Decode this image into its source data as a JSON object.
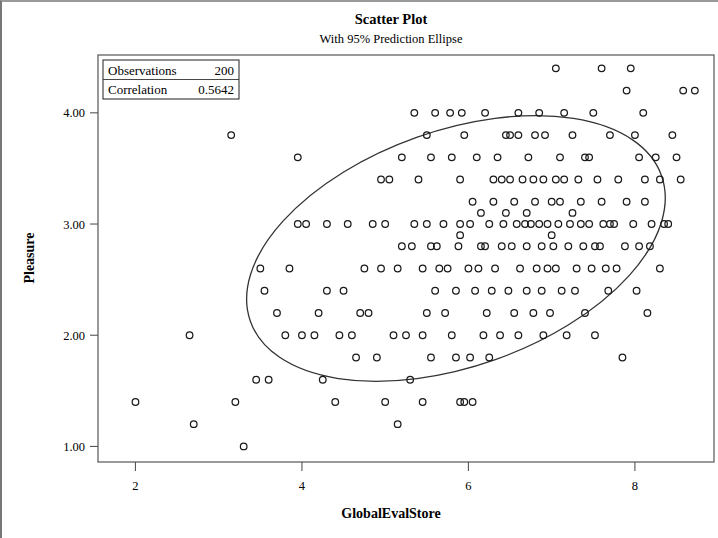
{
  "chart_data": {
    "type": "scatter",
    "title": "Scatter Plot",
    "subtitle": "With 95% Prediction Ellipse",
    "xlabel": "GlobalEvalStore",
    "ylabel": "Pleasure",
    "xlim": [
      1.55,
      8.95
    ],
    "ylim": [
      0.86,
      4.52
    ],
    "xticks": [
      2,
      4,
      6,
      8
    ],
    "xticklabels": [
      "2",
      "4",
      "6",
      "8"
    ],
    "yticks": [
      1.0,
      2.0,
      3.0,
      4.0
    ],
    "yticklabels": [
      "1.00",
      "2.00",
      "3.00",
      "4.00"
    ],
    "grid": false,
    "marker": "open-circle",
    "marker_color": "#1a1a1a",
    "legend": {
      "position": "top-left-inside",
      "rows": [
        {
          "label": "Observations",
          "value": "200"
        },
        {
          "label": "Correlation",
          "value": "0.5642"
        }
      ]
    },
    "annotations": [
      {
        "type": "ellipse",
        "label": "95% Prediction Ellipse",
        "cx": 5.85,
        "cy": 2.78,
        "rx": 2.62,
        "ry": 1.06,
        "rotation_deg": -19.5
      }
    ],
    "points": [
      [
        2.0,
        1.4
      ],
      [
        2.65,
        2.0
      ],
      [
        2.7,
        1.2
      ],
      [
        3.15,
        3.8
      ],
      [
        3.2,
        1.4
      ],
      [
        3.3,
        1.0
      ],
      [
        3.45,
        1.6
      ],
      [
        3.6,
        1.6
      ],
      [
        3.55,
        2.4
      ],
      [
        3.5,
        2.6
      ],
      [
        3.85,
        2.6
      ],
      [
        3.95,
        3.6
      ],
      [
        3.95,
        3.0
      ],
      [
        4.0,
        2.0
      ],
      [
        4.15,
        2.0
      ],
      [
        4.25,
        1.6
      ],
      [
        4.2,
        2.2
      ],
      [
        4.3,
        2.4
      ],
      [
        4.5,
        2.4
      ],
      [
        4.55,
        3.0
      ],
      [
        4.7,
        2.2
      ],
      [
        4.75,
        2.6
      ],
      [
        4.85,
        3.0
      ],
      [
        4.9,
        1.8
      ],
      [
        4.95,
        2.6
      ],
      [
        5.0,
        1.4
      ],
      [
        5.05,
        3.4
      ],
      [
        5.15,
        1.2
      ],
      [
        5.2,
        2.8
      ],
      [
        5.2,
        3.6
      ],
      [
        5.35,
        4.0
      ],
      [
        5.4,
        3.4
      ],
      [
        5.45,
        2.6
      ],
      [
        5.5,
        3.0
      ],
      [
        5.5,
        2.2
      ],
      [
        5.55,
        3.6
      ],
      [
        5.6,
        4.0
      ],
      [
        5.62,
        2.8
      ],
      [
        5.7,
        3.0
      ],
      [
        5.72,
        2.2
      ],
      [
        5.78,
        4.0
      ],
      [
        5.8,
        3.6
      ],
      [
        5.8,
        2.0
      ],
      [
        5.85,
        1.8
      ],
      [
        5.9,
        3.4
      ],
      [
        5.92,
        4.0
      ],
      [
        5.95,
        1.4
      ],
      [
        6.0,
        2.6
      ],
      [
        6.02,
        3.0
      ],
      [
        6.05,
        1.4
      ],
      [
        6.1,
        3.6
      ],
      [
        6.15,
        2.8
      ],
      [
        6.18,
        2.0
      ],
      [
        6.2,
        4.0
      ],
      [
        6.25,
        3.0
      ],
      [
        6.3,
        3.4
      ],
      [
        6.32,
        2.6
      ],
      [
        6.35,
        3.6
      ],
      [
        6.4,
        2.8
      ],
      [
        6.42,
        3.0
      ],
      [
        6.45,
        3.8
      ],
      [
        6.5,
        3.4
      ],
      [
        6.55,
        2.2
      ],
      [
        6.58,
        3.0
      ],
      [
        6.6,
        3.8
      ],
      [
        6.62,
        2.6
      ],
      [
        6.65,
        3.4
      ],
      [
        6.68,
        3.0
      ],
      [
        6.7,
        2.8
      ],
      [
        6.72,
        3.6
      ],
      [
        6.75,
        3.0
      ],
      [
        6.78,
        3.4
      ],
      [
        6.8,
        3.8
      ],
      [
        6.82,
        2.6
      ],
      [
        6.85,
        3.0
      ],
      [
        6.88,
        2.8
      ],
      [
        6.9,
        3.4
      ],
      [
        6.92,
        3.8
      ],
      [
        6.95,
        3.0
      ],
      [
        6.98,
        2.2
      ],
      [
        7.0,
        3.2
      ],
      [
        7.02,
        2.8
      ],
      [
        7.05,
        4.4
      ],
      [
        7.08,
        3.0
      ],
      [
        7.1,
        3.6
      ],
      [
        7.12,
        2.4
      ],
      [
        7.15,
        3.4
      ],
      [
        7.2,
        2.8
      ],
      [
        7.22,
        3.0
      ],
      [
        7.25,
        3.8
      ],
      [
        7.3,
        2.6
      ],
      [
        7.32,
        3.4
      ],
      [
        7.35,
        3.0
      ],
      [
        7.4,
        2.2
      ],
      [
        7.45,
        3.6
      ],
      [
        7.5,
        4.0
      ],
      [
        7.52,
        2.8
      ],
      [
        7.55,
        3.4
      ],
      [
        7.6,
        4.4
      ],
      [
        7.62,
        3.0
      ],
      [
        7.65,
        2.6
      ],
      [
        7.7,
        3.8
      ],
      [
        7.75,
        3.0
      ],
      [
        7.8,
        3.4
      ],
      [
        7.85,
        1.8
      ],
      [
        7.9,
        4.2
      ],
      [
        7.95,
        4.4
      ],
      [
        7.98,
        3.0
      ],
      [
        8.0,
        3.8
      ],
      [
        8.05,
        2.8
      ],
      [
        8.1,
        4.0
      ],
      [
        8.12,
        3.4
      ],
      [
        8.15,
        2.2
      ],
      [
        8.2,
        3.0
      ],
      [
        8.25,
        3.6
      ],
      [
        8.3,
        2.6
      ],
      [
        8.45,
        3.8
      ],
      [
        8.5,
        3.6
      ],
      [
        8.55,
        3.4
      ],
      [
        8.72,
        4.2
      ],
      [
        4.05,
        3.0
      ],
      [
        4.45,
        2.0
      ],
      [
        4.6,
        2.0
      ],
      [
        4.4,
        1.4
      ],
      [
        4.8,
        2.2
      ],
      [
        5.1,
        2.0
      ],
      [
        5.25,
        2.0
      ],
      [
        5.3,
        1.6
      ],
      [
        5.32,
        2.8
      ],
      [
        5.45,
        2.0
      ],
      [
        5.6,
        2.4
      ],
      [
        5.65,
        2.6
      ],
      [
        5.85,
        2.4
      ],
      [
        5.88,
        2.8
      ],
      [
        6.08,
        2.4
      ],
      [
        6.12,
        2.6
      ],
      [
        6.22,
        2.2
      ],
      [
        6.28,
        2.4
      ],
      [
        6.38,
        2.0
      ],
      [
        6.48,
        2.4
      ],
      [
        6.52,
        2.8
      ],
      [
        6.6,
        2.0
      ],
      [
        6.7,
        2.4
      ],
      [
        6.78,
        2.2
      ],
      [
        6.88,
        2.4
      ],
      [
        6.95,
        2.6
      ],
      [
        7.05,
        2.6
      ],
      [
        7.18,
        2.0
      ],
      [
        7.28,
        2.4
      ],
      [
        7.38,
        2.8
      ],
      [
        7.48,
        2.6
      ],
      [
        7.58,
        2.8
      ],
      [
        7.68,
        2.4
      ],
      [
        7.78,
        2.6
      ],
      [
        7.88,
        2.8
      ],
      [
        8.02,
        2.4
      ],
      [
        8.18,
        2.8
      ],
      [
        8.35,
        3.0
      ],
      [
        8.4,
        3.0
      ],
      [
        6.05,
        3.2
      ],
      [
        6.3,
        3.2
      ],
      [
        6.55,
        3.2
      ],
      [
        6.8,
        3.2
      ],
      [
        7.1,
        3.2
      ],
      [
        7.35,
        3.2
      ],
      [
        7.6,
        3.2
      ],
      [
        7.9,
        3.2
      ],
      [
        8.12,
        3.2
      ],
      [
        5.9,
        2.9
      ],
      [
        6.15,
        3.1
      ],
      [
        6.45,
        3.1
      ],
      [
        6.7,
        3.1
      ],
      [
        7.0,
        2.9
      ],
      [
        7.25,
        3.1
      ],
      [
        5.55,
        2.8
      ],
      [
        5.95,
        3.8
      ],
      [
        6.6,
        4.0
      ],
      [
        6.85,
        4.0
      ],
      [
        7.15,
        4.0
      ],
      [
        7.4,
        3.6
      ],
      [
        4.95,
        3.4
      ],
      [
        5.5,
        3.8
      ],
      [
        5.9,
        3.0
      ],
      [
        6.2,
        2.8
      ],
      [
        6.5,
        3.8
      ],
      [
        7.05,
        3.4
      ],
      [
        7.7,
        3.0
      ],
      [
        8.05,
        3.6
      ],
      [
        8.3,
        3.4
      ],
      [
        8.58,
        4.2
      ],
      [
        6.4,
        3.4
      ],
      [
        7.45,
        3.0
      ],
      [
        5.0,
        3.0
      ],
      [
        5.35,
        3.0
      ],
      [
        5.15,
        2.6
      ],
      [
        5.75,
        2.6
      ],
      [
        6.9,
        2.0
      ],
      [
        7.52,
        2.0
      ],
      [
        6.02,
        1.8
      ],
      [
        6.25,
        1.8
      ],
      [
        5.55,
        1.8
      ],
      [
        4.65,
        1.8
      ],
      [
        5.45,
        1.4
      ],
      [
        5.9,
        1.4
      ],
      [
        3.8,
        2.0
      ],
      [
        3.7,
        2.2
      ],
      [
        4.3,
        3.0
      ]
    ]
  }
}
